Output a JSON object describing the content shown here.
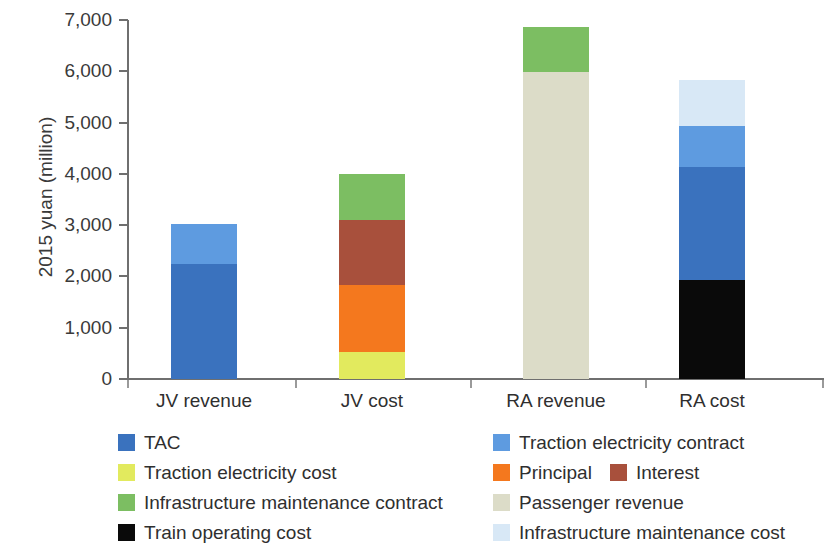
{
  "chart_data": {
    "type": "bar",
    "stacked": true,
    "title": "",
    "xlabel": "",
    "ylabel": "2015 yuan (million)",
    "ylim": [
      0,
      7000
    ],
    "ytick_labels": [
      "0",
      "1,000",
      "2,000",
      "3,000",
      "4,000",
      "5,000",
      "6,000",
      "7,000"
    ],
    "ytick_values": [
      0,
      1000,
      2000,
      3000,
      4000,
      5000,
      6000,
      7000
    ],
    "grid": false,
    "legend_position": "bottom",
    "categories": [
      "JV revenue",
      "JV cost",
      "RA revenue",
      "RA cost"
    ],
    "series": [
      {
        "name": "TAC",
        "color": "#3A72BE",
        "values": [
          2240,
          0,
          0,
          2200
        ]
      },
      {
        "name": "Traction electricity contract",
        "color": "#5E9BE0",
        "values": [
          780,
          0,
          0,
          800
        ]
      },
      {
        "name": "Traction electricity cost",
        "color": "#E2EA5E",
        "values": [
          0,
          520,
          0,
          0
        ]
      },
      {
        "name": "Principal",
        "color": "#F4781E",
        "values": [
          0,
          1320,
          0,
          0
        ]
      },
      {
        "name": "Interest",
        "color": "#A8503C",
        "values": [
          0,
          1270,
          0,
          0
        ]
      },
      {
        "name": "Infrastructure maintenance contract",
        "color": "#7CBE62",
        "values": [
          0,
          890,
          880,
          0
        ]
      },
      {
        "name": "Passenger revenue",
        "color": "#DCDCC8",
        "values": [
          0,
          0,
          5980,
          0
        ]
      },
      {
        "name": "Train operating cost",
        "color": "#0A0A0A",
        "values": [
          0,
          0,
          0,
          1930
        ]
      },
      {
        "name": "Infrastructure maintenance cost",
        "color": "#D8E8F6",
        "values": [
          0,
          0,
          0,
          900
        ]
      }
    ],
    "totals": [
      3020,
      4000,
      6860,
      5830
    ],
    "stacks": [
      {
        "category": "JV revenue",
        "segments": [
          {
            "name": "TAC",
            "color": "#3A72BE",
            "value": 2240
          },
          {
            "name": "Traction electricity contract",
            "color": "#5E9BE0",
            "value": 780
          }
        ]
      },
      {
        "category": "JV cost",
        "segments": [
          {
            "name": "Traction electricity cost",
            "color": "#E2EA5E",
            "value": 520
          },
          {
            "name": "Principal",
            "color": "#F4781E",
            "value": 1320
          },
          {
            "name": "Interest",
            "color": "#A8503C",
            "value": 1270
          },
          {
            "name": "Infrastructure maintenance contract",
            "color": "#7CBE62",
            "value": 890
          }
        ]
      },
      {
        "category": "RA revenue",
        "segments": [
          {
            "name": "Passenger revenue",
            "color": "#DCDCC8",
            "value": 5980
          },
          {
            "name": "Infrastructure maintenance contract",
            "color": "#7CBE62",
            "value": 880
          }
        ]
      },
      {
        "category": "RA cost",
        "segments": [
          {
            "name": "Train operating cost",
            "color": "#0A0A0A",
            "value": 1930
          },
          {
            "name": "TAC",
            "color": "#3A72BE",
            "value": 2200
          },
          {
            "name": "Traction electricity contract",
            "color": "#5E9BE0",
            "value": 800
          },
          {
            "name": "Infrastructure maintenance cost",
            "color": "#D8E8F6",
            "value": 900
          }
        ]
      }
    ],
    "legend": {
      "rows": [
        [
          {
            "label": "TAC",
            "color": "#3A72BE"
          },
          {
            "label": "Traction electricity contract",
            "color": "#5E9BE0"
          }
        ],
        [
          {
            "label": "Traction electricity cost",
            "color": "#E2EA5E"
          },
          {
            "label": "Principal",
            "color": "#F4781E"
          },
          {
            "label": "Interest",
            "color": "#A8503C"
          }
        ],
        [
          {
            "label": "Infrastructure maintenance contract",
            "color": "#7CBE62"
          },
          {
            "label": "Passenger revenue",
            "color": "#DCDCC8"
          }
        ],
        [
          {
            "label": "Train operating cost",
            "color": "#0A0A0A"
          },
          {
            "label": "Infrastructure maintenance cost",
            "color": "#D8E8F6"
          }
        ]
      ]
    }
  }
}
